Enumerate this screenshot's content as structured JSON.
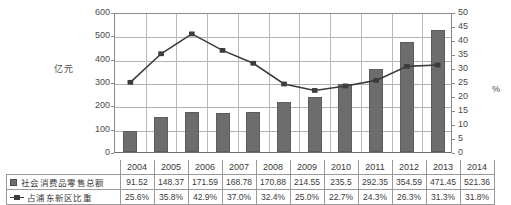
{
  "chart_data": {
    "type": "bar",
    "title": "",
    "subtitle": "",
    "xlabel": "",
    "ylabel": "亿元",
    "y2label": "%",
    "ylim": [
      0,
      600
    ],
    "y2lim": [
      0,
      50
    ],
    "yticks": [
      "600",
      "500",
      "400",
      "300",
      "200",
      "100",
      "0"
    ],
    "y2ticks": [
      "50",
      "45",
      "40",
      "35",
      "30",
      "25",
      "20",
      "15",
      "10",
      "5",
      "0"
    ],
    "grid": true,
    "legend_position": "table-bottom",
    "categories": [
      "2004",
      "2005",
      "2006",
      "2007",
      "2008",
      "2009",
      "2010",
      "2011",
      "2012",
      "2013",
      "2014"
    ],
    "series": [
      {
        "name": "社会消费品零售总额",
        "type": "bar",
        "axis": "left",
        "unit": "亿元",
        "color": "#6e6c6c",
        "values": [
          91.52,
          148.37,
          171.59,
          168.78,
          170.88,
          214.55,
          235.5,
          292.35,
          354.59,
          471.45,
          521.36
        ],
        "labels": [
          "91.52",
          "148.37",
          "171.59",
          "168.78",
          "170.88",
          "214.55",
          "235.5",
          "292.35",
          "354.59",
          "471.45",
          "521.36"
        ]
      },
      {
        "name": "占浦东新区比重",
        "type": "line",
        "axis": "right",
        "unit": "%",
        "color": "#3c3c3c",
        "values": [
          25.6,
          35.8,
          42.9,
          37.0,
          32.4,
          25.0,
          22.7,
          24.3,
          26.3,
          31.3,
          31.8
        ],
        "labels": [
          "25.6%",
          "35.8%",
          "42.9%",
          "37.0%",
          "32.4%",
          "25.0%",
          "22.7%",
          "24.3%",
          "26.3%",
          "31.3%",
          "31.8%"
        ]
      }
    ]
  },
  "axes": {
    "left_title": "亿元",
    "right_title": "%"
  },
  "table": {
    "year_header_legend": "",
    "rows": [
      {
        "legend": "社会消费品零售总额",
        "marker": "square-swatch"
      },
      {
        "legend": "占浦东新区比重",
        "marker": "line-marker"
      }
    ]
  }
}
